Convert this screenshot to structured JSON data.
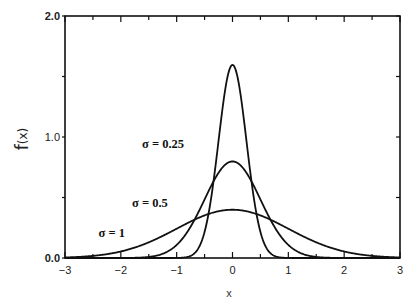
{
  "chart_data": {
    "type": "line",
    "title": "",
    "xlabel": "x",
    "ylabel": "f(x)",
    "xlim": [
      -3,
      3
    ],
    "ylim": [
      0,
      2.0
    ],
    "grid": false,
    "legend": null,
    "x_ticks": [
      "-3",
      "-2",
      "-1",
      "0",
      "1",
      "2",
      "3"
    ],
    "y_ticks": [
      "0.0",
      "1.0",
      "2.0"
    ],
    "x_minor_step": 0.5,
    "y_minor_step": 0.5,
    "series": [
      {
        "name": "σ = 0.25",
        "sigma": 0.25,
        "peak": 1.596,
        "x": [
          -3,
          -1,
          -0.75,
          -0.5,
          -0.375,
          -0.25,
          -0.125,
          0,
          0.125,
          0.25,
          0.375,
          0.5,
          0.75,
          1,
          3
        ],
        "y": [
          0,
          0.0001,
          0.018,
          0.216,
          0.518,
          0.968,
          1.408,
          1.596,
          1.408,
          0.968,
          0.518,
          0.216,
          0.018,
          0.0001,
          0
        ]
      },
      {
        "name": "σ = 0.5",
        "sigma": 0.5,
        "peak": 0.798,
        "x": [
          -3,
          -2,
          -1.5,
          -1,
          -0.75,
          -0.5,
          -0.25,
          0,
          0.25,
          0.5,
          0.75,
          1,
          1.5,
          2,
          3
        ],
        "y": [
          0,
          0.0003,
          0.009,
          0.108,
          0.259,
          0.484,
          0.704,
          0.798,
          0.704,
          0.484,
          0.259,
          0.108,
          0.009,
          0.0003,
          0
        ]
      },
      {
        "name": "σ = 1",
        "sigma": 1.0,
        "peak": 0.399,
        "x": [
          -3,
          -2.5,
          -2,
          -1.5,
          -1,
          -0.5,
          0,
          0.5,
          1,
          1.5,
          2,
          2.5,
          3
        ],
        "y": [
          0.004,
          0.018,
          0.054,
          0.13,
          0.242,
          0.352,
          0.399,
          0.352,
          0.242,
          0.13,
          0.054,
          0.018,
          0.004
        ]
      }
    ],
    "annotations": [
      {
        "text": "σ = 0.25",
        "x": -1.62,
        "y": 0.91
      },
      {
        "text": "σ = 0.5",
        "x": -1.8,
        "y": 0.42
      },
      {
        "text": "σ = 1",
        "x": -2.4,
        "y": 0.17
      }
    ]
  },
  "axes": {
    "xlabel": "x",
    "ylabel_main": "f",
    "ylabel_arg": "(x)"
  }
}
